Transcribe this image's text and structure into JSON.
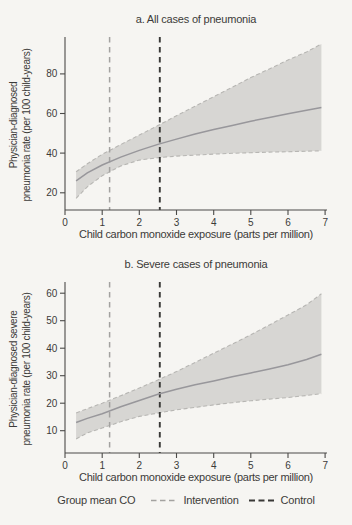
{
  "colors": {
    "background": "#f6f5f2",
    "band": "#d7d6d3",
    "band_edge": "#b7b6b3",
    "fit_line": "#98979b",
    "intervention": "#a3a2a0",
    "control": "#393836",
    "axis": "#4b4a48",
    "text": "#3c3b39"
  },
  "legend": {
    "label": "Group mean CO",
    "items": [
      {
        "name": "intervention",
        "label": "Intervention"
      },
      {
        "name": "control",
        "label": "Control"
      }
    ]
  },
  "chart_data": [
    {
      "type": "line",
      "panel": "a",
      "title": "a. All cases of pneumonia",
      "xlabel": "Child carbon monoxide exposure (parts per million)",
      "ylabel": "Physician-diagnosed pneumonia rate (per 100 child-years)",
      "ylabel_lines": [
        "Physician-diagnosed",
        "pneumonia rate (per 100 child-years)"
      ],
      "xlim": [
        0,
        7.05
      ],
      "ylim": [
        11.3,
        97.1
      ],
      "xticks": [
        0,
        1,
        2,
        3,
        4,
        5,
        6,
        7
      ],
      "yticks": [
        20,
        40,
        60,
        80
      ],
      "grid": false,
      "x": [
        0.3,
        0.6,
        1,
        1.5,
        2,
        2.5,
        3,
        3.5,
        4,
        4.5,
        5,
        5.5,
        6,
        6.5,
        6.9
      ],
      "series": [
        {
          "name": "Fitted pneumonia rate",
          "values": [
            26,
            30,
            34,
            38,
            41.4,
            44.4,
            47.1,
            49.6,
            51.9,
            54,
            56.1,
            58,
            59.9,
            61.6,
            63
          ]
        },
        {
          "name": "Upper 95% CI",
          "values": [
            30.6,
            34.6,
            39.4,
            44.3,
            49.1,
            53.9,
            58.9,
            63.7,
            68.5,
            73.3,
            78.1,
            82.5,
            87,
            91.1,
            95.1
          ]
        },
        {
          "name": "Lower 95% CI",
          "values": [
            17.2,
            23,
            28.6,
            33.5,
            36.5,
            37.7,
            38.5,
            39,
            39.5,
            39.9,
            40.2,
            40.5,
            40.7,
            41,
            41.2
          ]
        }
      ],
      "vlines": [
        {
          "name": "Intervention group mean CO",
          "x": 1.2
        },
        {
          "name": "Control group mean CO",
          "x": 2.55
        }
      ]
    },
    {
      "type": "line",
      "panel": "b",
      "title": "b. Severe cases of pneumonia",
      "xlabel": "Child carbon monoxide exposure (parts per million)",
      "ylabel": "Physician-diagnosed severe pneumonia rate (per 100 child-years)",
      "ylabel_lines": [
        "Physician-diagnosed severe",
        "pneumonia rate (per 100 child-years)"
      ],
      "xlim": [
        0,
        7.05
      ],
      "ylim": [
        1.9,
        63
      ],
      "xticks": [
        0,
        1,
        2,
        3,
        4,
        5,
        6,
        7
      ],
      "yticks": [
        10,
        20,
        30,
        40,
        50,
        60
      ],
      "grid": false,
      "x": [
        0.3,
        0.6,
        1,
        1.5,
        2,
        2.5,
        3,
        3.5,
        4,
        4.5,
        5,
        5.5,
        6,
        6.5,
        6.9
      ],
      "series": [
        {
          "name": "Fitted severe pneumonia rate",
          "values": [
            13,
            14.5,
            16.2,
            18.7,
            21,
            23.3,
            25.1,
            26.7,
            28.1,
            29.6,
            31,
            32.5,
            34,
            35.9,
            37.8
          ]
        },
        {
          "name": "Upper 95% CI",
          "values": [
            16.5,
            18,
            20,
            22.7,
            25.5,
            28.5,
            31.5,
            34.8,
            38.2,
            41.5,
            44.9,
            48.5,
            52.1,
            55.8,
            59.8
          ]
        },
        {
          "name": "Lower 95% CI",
          "values": [
            7,
            9.2,
            11,
            13.3,
            15.2,
            16.4,
            17.6,
            18.5,
            19.4,
            20.2,
            20.9,
            21.5,
            22.1,
            22.8,
            23.5
          ]
        }
      ],
      "vlines": [
        {
          "name": "Intervention group mean CO",
          "x": 1.2
        },
        {
          "name": "Control group mean CO",
          "x": 2.55
        }
      ]
    }
  ]
}
